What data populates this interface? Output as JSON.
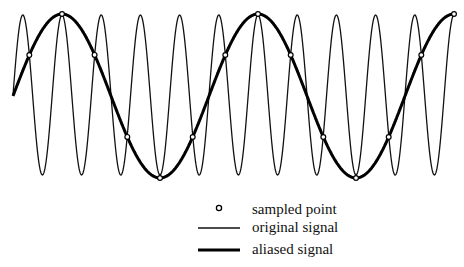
{
  "diagram": {
    "title": "",
    "original_signal": {
      "cycles_per_alias_cycle": 5,
      "amplitude_px": 80,
      "center_y": 95,
      "color": "#111111",
      "stroke_width": 1.3
    },
    "aliased_signal": {
      "period_px": 196,
      "amplitude_px": 82,
      "center_y": 96,
      "phase_peak_x": 62,
      "color": "#000000",
      "stroke_width": 3
    },
    "x_start": 13,
    "x_end": 455,
    "sample_spacing_px": 32.67,
    "sample_first_x": 29.3
  },
  "legend": {
    "items": [
      {
        "symbol": "sampled-point",
        "label": "sampled point"
      },
      {
        "symbol": "thin-line",
        "label": "original signal"
      },
      {
        "symbol": "thick-line",
        "label": "aliased signal"
      }
    ]
  }
}
